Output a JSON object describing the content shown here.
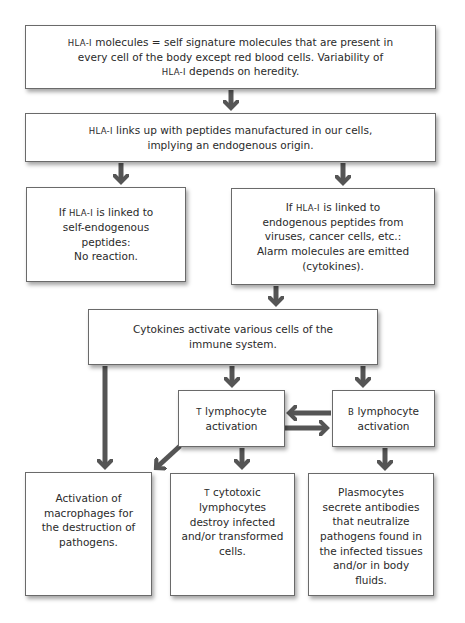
{
  "diagram": {
    "arrow_color": "#555555",
    "nodes": {
      "hla_definition": {
        "lead": "HLA-I",
        "text": " molecules = self signature molecules that are present in\nevery cell of the body except red blood cells. Variability of\n",
        "lead2": "HLA-I",
        "tail": " depends on heredity."
      },
      "hla_links": {
        "lead": "HLA-I",
        "text": " links up with peptides manufactured in our cells,\nimplying an endogenous origin."
      },
      "self_peptides": {
        "pre": "If ",
        "lead": "HLA-I",
        "text": " is linked to\nself-endogenous\npeptides:\nNo reaction."
      },
      "foreign_peptides": {
        "pre": "If ",
        "lead": "HLA-I",
        "text": " is linked to\nendogenous peptides from\nviruses, cancer cells, etc.:\nAlarm molecules are emitted\n(cytokines)."
      },
      "cytokines": {
        "text": "Cytokines activate various cells of the\nimmune system."
      },
      "t_activation": {
        "lead": "T",
        "text": " lymphocyte\nactivation"
      },
      "b_activation": {
        "lead": "B",
        "text": " lymphocyte\nactivation"
      },
      "macrophages": {
        "text": "Activation of\nmacrophages for\nthe destruction of\npathogens."
      },
      "t_cytotoxic": {
        "lead": "T",
        "text": " cytotoxic\nlymphocytes\ndestroy infected\nand/or transformed\ncells."
      },
      "plasmocytes": {
        "text": "Plasmocytes\nsecrete antibodies\nthat neutralize\npathogens found in\nthe infected tissues\nand/or in body\nfluids."
      }
    },
    "edges": [
      [
        "hla_definition",
        "hla_links"
      ],
      [
        "hla_links",
        "self_peptides"
      ],
      [
        "hla_links",
        "foreign_peptides"
      ],
      [
        "foreign_peptides",
        "cytokines"
      ],
      [
        "cytokines",
        "t_activation"
      ],
      [
        "cytokines",
        "b_activation"
      ],
      [
        "cytokines",
        "macrophages"
      ],
      [
        "b_activation",
        "t_activation"
      ],
      [
        "t_activation",
        "b_activation"
      ],
      [
        "t_activation",
        "macrophages"
      ],
      [
        "t_activation",
        "t_cytotoxic"
      ],
      [
        "b_activation",
        "plasmocytes"
      ]
    ]
  }
}
